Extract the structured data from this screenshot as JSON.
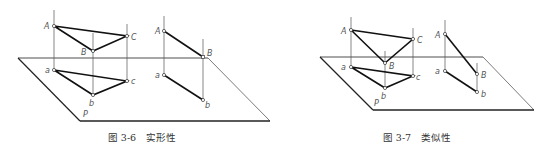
{
  "figures": [
    {
      "id": "fig-3-6",
      "caption": "图 3-6　实形性",
      "plane_label": "P",
      "triangle_labels": {
        "A": "A",
        "B": "B",
        "C": "C",
        "a": "a",
        "b": "b",
        "c": "c"
      },
      "segment_labels": {
        "A": "A",
        "B": "B",
        "a": "a",
        "b": "b"
      },
      "property": "true shape (parallel to projection plane)"
    },
    {
      "id": "fig-3-7",
      "caption": "图 3-7　类似性",
      "plane_label": "P",
      "triangle_labels": {
        "A": "A",
        "B": "B",
        "C": "C",
        "a": "a",
        "b": "b",
        "c": "c"
      },
      "segment_labels": {
        "A": "A",
        "B": "B",
        "a": "a",
        "b": "b"
      },
      "property": "similarity (inclined to projection plane)"
    }
  ]
}
